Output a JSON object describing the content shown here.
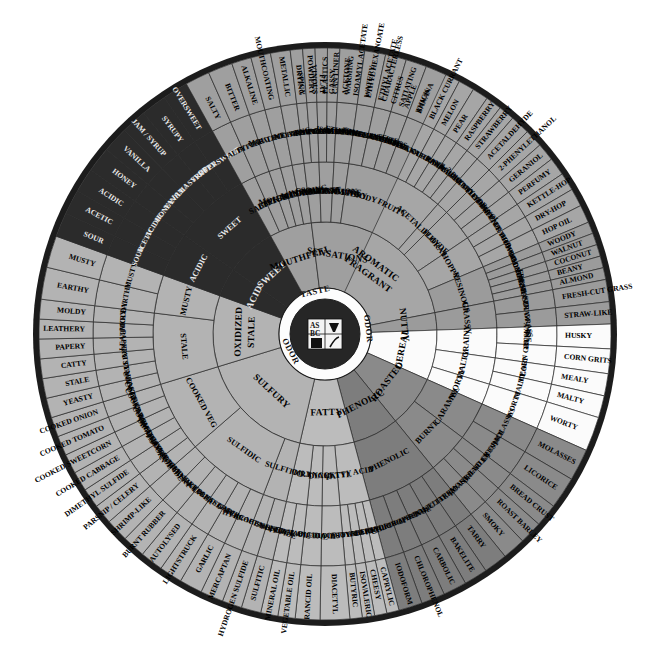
{
  "center": {
    "logo_text": "ASBC",
    "labels": [
      "TASTE",
      "ODOR",
      "ODOR"
    ],
    "taste_label": "TASTE",
    "odor_label_left": "ODOR",
    "odor_label_right": "ODOR"
  },
  "colors": {
    "background": "#ffffff",
    "rim": "#1c1c1c",
    "grey_light": "#b9b9b9",
    "grey_mid": "#a6a6a6",
    "grey_dark": "#8f8f8f",
    "grey_darker": "#7b7b7b",
    "near_black": "#2b2b2b",
    "white_slice": "#fbfbfb",
    "stroke": "#2a2a2a",
    "text": "#000000",
    "text_light": "#e9e9e9"
  },
  "groups": [
    {
      "name": "AROMATIC FRAGRANT",
      "fill": "#a6a6a6",
      "start": 0,
      "end": 86,
      "classes": [
        {
          "name": "ALCOHOLIC",
          "fill": "#a6a6a6",
          "span": 6,
          "items": [
            {
              "name": "SPICY"
            },
            {
              "name": "VINOUS"
            }
          ]
        },
        {
          "name": "SOLVENT-LIKE",
          "fill": "#a6a6a6",
          "span": 7,
          "items": [
            {
              "name": "PLASTICS"
            },
            {
              "name": "CAN LINER"
            },
            {
              "name": "ACETONE"
            }
          ]
        },
        {
          "name": "ESTERY",
          "fill": "#a6a6a6",
          "span": 9,
          "items": [
            {
              "name": "ISOAMYL ACETATE"
            },
            {
              "name": "ETHYL HEXANOATE"
            },
            {
              "name": "ETHYL ACETATE"
            }
          ]
        },
        {
          "name": "FRUITY",
          "fill": "#a6a6a6",
          "span": 26,
          "items": [
            {
              "name": "CITRUS"
            },
            {
              "name": "APPLE"
            },
            {
              "name": "BANANA"
            },
            {
              "name": "BLACK CURRANT"
            },
            {
              "name": "MELON"
            },
            {
              "name": "PEAR"
            },
            {
              "name": "RASPBERRY"
            },
            {
              "name": "STRAWBERRY"
            }
          ]
        },
        {
          "name": "ACETALDEHYDE",
          "fill": "#a6a6a6",
          "span": 4,
          "items": [
            {
              "name": "ACETALDEHYDE"
            }
          ]
        },
        {
          "name": "FLORAL",
          "fill": "#a6a6a6",
          "span": 11,
          "items": [
            {
              "name": "2-PHENYLETHANOL"
            },
            {
              "name": "GERANIOL"
            },
            {
              "name": "PERFUMY"
            }
          ]
        },
        {
          "name": "HOPPY",
          "fill": "#a6a6a6",
          "span": 11,
          "items": [
            {
              "name": "KETTLE-HOP"
            },
            {
              "name": "DRY-HOP"
            },
            {
              "name": "HOP OIL"
            }
          ]
        },
        {
          "name": "RESINOUS",
          "fill": "#9b9b9b",
          "span": 12,
          "items": [
            {
              "name": "WOODY"
            },
            {
              "name": "WALNUT"
            },
            {
              "name": "COCONUT"
            },
            {
              "name": "BEANY"
            },
            {
              "name": "ALMOND"
            }
          ]
        }
      ]
    },
    {
      "name": "NUTTY",
      "fill": "#9b9b9b",
      "start": 86,
      "end": 95,
      "classes": [
        {
          "name": "GRASSY",
          "fill": "#9b9b9b",
          "span": 9,
          "items": [
            {
              "name": "FRESH-CUT GRASS"
            },
            {
              "name": "STRAW-LIKE"
            }
          ]
        }
      ]
    },
    {
      "name": "CEREAL",
      "fill": "#fbfbfb",
      "start": 95,
      "end": 121,
      "classes": [
        {
          "name": "GRAINY",
          "fill": "#fbfbfb",
          "span": 10,
          "items": [
            {
              "name": "HUSKY"
            },
            {
              "name": "CORN GRITS"
            }
          ]
        },
        {
          "name": "MALTY",
          "fill": "#fbfbfb",
          "span": 9,
          "items": [
            {
              "name": "MEALY"
            },
            {
              "name": "MALTY"
            }
          ]
        },
        {
          "name": "WORTY",
          "fill": "#fbfbfb",
          "span": 7,
          "items": [
            {
              "name": "WORTY"
            }
          ]
        }
      ]
    },
    {
      "name": "ROASTED",
      "fill": "#8a8a8a",
      "start": 121,
      "end": 148,
      "classes": [
        {
          "name": "CARAMEL",
          "fill": "#8a8a8a",
          "span": 13,
          "items": [
            {
              "name": "MOLASSES"
            },
            {
              "name": "LICORICE"
            }
          ]
        },
        {
          "name": "BURNT",
          "fill": "#8a8a8a",
          "span": 14,
          "items": [
            {
              "name": "BREAD CRUST"
            },
            {
              "name": "ROAST BARLEY"
            },
            {
              "name": "SMOKY"
            }
          ]
        }
      ]
    },
    {
      "name": "PHENOLIC",
      "fill": "#7d7d7d",
      "start": 148,
      "end": 172,
      "classes": [
        {
          "name": "PHENOLIC",
          "fill": "#7d7d7d",
          "span": 24,
          "items": [
            {
              "name": "TARRY"
            },
            {
              "name": "BAKELITE"
            },
            {
              "name": "CARBOLIC"
            },
            {
              "name": "CHLOROPHENOL"
            },
            {
              "name": "IODOFORM"
            }
          ]
        }
      ]
    },
    {
      "name": "FATTY",
      "fill": "#bcbcbc",
      "start": 172,
      "end": 200,
      "classes": [
        {
          "name": "FATTY ACID",
          "fill": "#bcbcbc",
          "span": 10,
          "items": [
            {
              "name": "CAPRYLIC"
            },
            {
              "name": "CHEESY"
            },
            {
              "name": "ISOVALERIC"
            },
            {
              "name": "BUTYRIC"
            }
          ]
        },
        {
          "name": "DIACETYL",
          "fill": "#bcbcbc",
          "span": 6,
          "items": [
            {
              "name": "DIACETYL"
            }
          ]
        },
        {
          "name": "RANCID",
          "fill": "#bcbcbc",
          "span": 5,
          "items": [
            {
              "name": "RANCID OIL"
            }
          ]
        },
        {
          "name": "OILY",
          "fill": "#bcbcbc",
          "span": 7,
          "items": [
            {
              "name": "VEGETABLE OIL"
            },
            {
              "name": "MINERAL OIL"
            }
          ]
        }
      ]
    },
    {
      "name": "SULFURY",
      "fill": "#b3b3b3",
      "start": 200,
      "end": 260,
      "classes": [
        {
          "name": "SULFITIC",
          "fill": "#b3b3b3",
          "span": 8,
          "items": [
            {
              "name": "SULFITIC"
            },
            {
              "name": "HYDROGEN SULFIDE"
            }
          ]
        },
        {
          "name": "SULFIDIC",
          "fill": "#b3b3b3",
          "span": 28,
          "items": [
            {
              "name": "MERCAPTAN"
            },
            {
              "name": "GARLIC"
            },
            {
              "name": "LIGHTSTRUCK"
            },
            {
              "name": "AUTOLYSED"
            },
            {
              "name": "BURNT RUBBER"
            },
            {
              "name": "SHRIMP-LIKE"
            }
          ]
        },
        {
          "name": "COOKED VEG",
          "fill": "#b3b3b3",
          "span": 24,
          "items": [
            {
              "name": "PARSNIP / CELERY"
            },
            {
              "name": "DIMETHYL SULFIDE"
            },
            {
              "name": "COOKED CABBAGE"
            },
            {
              "name": "COOKED SWEETCORN"
            },
            {
              "name": "COOKED TOMATO"
            },
            {
              "name": "COOKED ONION"
            }
          ]
        }
      ]
    },
    {
      "name": "OXIDIZED STALE",
      "fill": "#b3b3b3",
      "start": 260,
      "end": 297,
      "classes": [
        {
          "name": "STALE",
          "fill": "#b3b3b3",
          "span": 24,
          "items": [
            {
              "name": "YEASTY"
            },
            {
              "name": "STALE"
            },
            {
              "name": "CATTY"
            },
            {
              "name": "PAPERY"
            },
            {
              "name": "LEATHERY"
            },
            {
              "name": "MOLDY"
            }
          ]
        },
        {
          "name": "MUSTY",
          "fill": "#b3b3b3",
          "span": 13,
          "items": [
            {
              "name": "EARTHY"
            },
            {
              "name": "MUSTY"
            }
          ]
        }
      ]
    },
    {
      "name": "ACID",
      "fill": "#2b2b2b",
      "start": 297,
      "end": 312,
      "dark": true,
      "classes": [
        {
          "name": "ACIDIC",
          "fill": "#2b2b2b",
          "span": 15,
          "dark": true,
          "items": [
            {
              "name": "SOUR"
            },
            {
              "name": "ACETIC"
            },
            {
              "name": "ACIDIC"
            }
          ]
        }
      ]
    },
    {
      "name": "SWEET",
      "fill": "#2b2b2b",
      "start": 312,
      "end": 338,
      "dark": true,
      "classes": [
        {
          "name": "SWEET",
          "fill": "#2b2b2b",
          "span": 26,
          "dark": true,
          "items": [
            {
              "name": "HONEY"
            },
            {
              "name": "VANILLA"
            },
            {
              "name": "JAM / SYRUP"
            },
            {
              "name": "SYRUPY"
            },
            {
              "name": "OVERSWEET"
            }
          ]
        }
      ]
    },
    {
      "name": "MOUTHFEEL",
      "fill": "#9f9f9f",
      "start": 338,
      "end": 360,
      "classes": [
        {
          "name": "SALTY",
          "fill": "#9f9f9f",
          "span": 5,
          "items": [
            {
              "name": "SALTY"
            }
          ]
        },
        {
          "name": "BITTER",
          "fill": "#9f9f9f",
          "span": 5,
          "items": [
            {
              "name": "BITTER"
            }
          ]
        },
        {
          "name": "ALKALINE",
          "fill": "#9f9f9f",
          "span": 4,
          "items": [
            {
              "name": "ALKALINE"
            }
          ]
        },
        {
          "name": "MOUTHCOATING",
          "fill": "#9f9f9f",
          "span": 4,
          "items": [
            {
              "name": "MOUTHCOATING"
            }
          ]
        },
        {
          "name": "METALLIC",
          "fill": "#9f9f9f",
          "span": 4,
          "items": [
            {
              "name": "METALLIC"
            }
          ]
        }
      ]
    },
    {
      "name": "SENSATIONS",
      "fill": "#9f9f9f",
      "start": 360,
      "end": 392,
      "classes": [
        {
          "name": "ASTRINGENT",
          "fill": "#9f9f9f",
          "span": 5,
          "items": [
            {
              "name": "DRYING"
            },
            {
              "name": "POWDERY"
            }
          ]
        },
        {
          "name": "CARBONATION",
          "fill": "#9f9f9f",
          "span": 5,
          "items": [
            {
              "name": "FLAT"
            },
            {
              "name": "GASSY"
            }
          ]
        },
        {
          "name": "WARMING",
          "fill": "#9f9f9f",
          "span": 5,
          "items": [
            {
              "name": "WARMING"
            }
          ]
        },
        {
          "name": "BODY",
          "fill": "#9f9f9f",
          "span": 17,
          "items": [
            {
              "name": "WATERY"
            },
            {
              "name": "CHARACTERLESS"
            },
            {
              "name": "SATIATING"
            },
            {
              "name": "THICK"
            }
          ]
        }
      ]
    }
  ],
  "radii": {
    "hub": 46,
    "ring1": 112,
    "ring2": 172,
    "ring3": 232,
    "rim_outer": 292,
    "rim_inner": 286
  }
}
